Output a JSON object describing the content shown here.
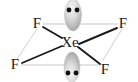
{
  "figure": {
    "name": "lewis-structure-xenon-tetrafluoride",
    "formula": "XeF4",
    "geometry": "square planar",
    "background_color": "#ffffff",
    "bond_color": "#1b1b1b",
    "guide_line_color": "#b9b9b9",
    "lobe_color": "#c9c9c9",
    "electron_dot_color": "#111111",
    "label_color": "#1a1a1a"
  },
  "atoms": {
    "center": {
      "symbol": "Xe",
      "name": "xenon",
      "x": 69,
      "y": 42
    },
    "ligands": [
      {
        "symbol": "F",
        "name": "fluorine-top-left",
        "x": 37,
        "y": 23
      },
      {
        "symbol": "F",
        "name": "fluorine-top-right",
        "x": 123,
        "y": 23
      },
      {
        "symbol": "F",
        "name": "fluorine-bottom-left",
        "x": 15,
        "y": 64
      },
      {
        "symbol": "F",
        "name": "fluorine-bottom-right",
        "x": 105,
        "y": 69
      }
    ]
  },
  "bonds": [
    {
      "name": "bond-xe-f-top-left",
      "from": "Xe",
      "to": "F",
      "x1": 62,
      "y1": 38,
      "x2": 42,
      "y2": 26
    },
    {
      "name": "bond-xe-f-top-right",
      "from": "Xe",
      "to": "F",
      "x1": 78,
      "y1": 44,
      "x2": 118,
      "y2": 27
    },
    {
      "name": "bond-xe-f-bottom-left",
      "from": "Xe",
      "to": "F",
      "x1": 62,
      "y1": 46,
      "x2": 21,
      "y2": 64
    },
    {
      "name": "bond-xe-f-bottom-right",
      "from": "Xe",
      "to": "F",
      "x1": 77,
      "y1": 47,
      "x2": 100,
      "y2": 65
    }
  ],
  "guide_lines": [
    {
      "name": "guide-line-top-edge",
      "x1": 43,
      "y1": 24,
      "x2": 118,
      "y2": 24
    },
    {
      "name": "guide-line-bottom-edge",
      "x1": 21,
      "y1": 65,
      "x2": 100,
      "y2": 65
    },
    {
      "name": "guide-line-left-edge",
      "x1": 37,
      "y1": 28,
      "x2": 17,
      "y2": 60
    },
    {
      "name": "guide-line-right-edge",
      "x1": 122,
      "y1": 28,
      "x2": 103,
      "y2": 61
    }
  ],
  "lone_pairs": [
    {
      "name": "lone-pair-top",
      "position": "axial-top",
      "electron_count": 2,
      "lobe": {
        "cx": 73,
        "cy": 14,
        "rx": 9,
        "ry": 16
      },
      "dots": [
        {
          "x": 69,
          "y": 10
        },
        {
          "x": 77,
          "y": 10
        }
      ]
    },
    {
      "name": "lone-pair-bottom",
      "position": "axial-bottom",
      "electron_count": 2,
      "lobe": {
        "cx": 72,
        "cy": 68,
        "rx": 8,
        "ry": 15
      },
      "dots": [
        {
          "x": 68,
          "y": 73
        },
        {
          "x": 76,
          "y": 73
        }
      ]
    }
  ]
}
